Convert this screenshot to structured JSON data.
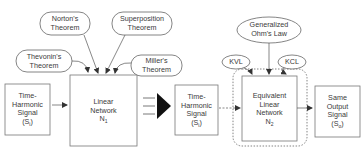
{
  "theorems": {
    "norton": {
      "line1": "Norton's",
      "line2": "Theorem"
    },
    "superposition": {
      "line1": "Superposition",
      "line2": "Theorem"
    },
    "thevenin": {
      "line1": "Thevonin's",
      "line2": "Theorem"
    },
    "miller": {
      "line1": "Miller's",
      "line2": "Theorem"
    }
  },
  "laws": {
    "ohm": {
      "line1": "Generalized",
      "line2": "Ohm's Law"
    },
    "kvl": {
      "label": "KVL"
    },
    "kcl": {
      "label": "KCL"
    }
  },
  "input_signal_1": {
    "line1": "Time-",
    "line2": "Harmonic",
    "line3": "Signal",
    "sym": "(S",
    "sub": "i",
    "close": ")"
  },
  "linear_network": {
    "line1": "Linear",
    "line2": "Network",
    "sym": "N",
    "sub": "1"
  },
  "input_signal_2": {
    "line1": "Time-",
    "line2": "Harmonic",
    "line3": "Signal",
    "sym": "(S",
    "sub": "i",
    "close": ")"
  },
  "equivalent_network": {
    "line1": "Equivalent",
    "line2": "Linear",
    "line3": "Network",
    "sym": "N",
    "sub": "2"
  },
  "output_signal": {
    "line1": "Same",
    "line2": "Output",
    "line3": "Signal",
    "sym": "(S",
    "sub": "o",
    "close": ")"
  },
  "colors": {
    "stroke": "#555555",
    "text": "#3a3a3a",
    "background": "#ffffff"
  }
}
